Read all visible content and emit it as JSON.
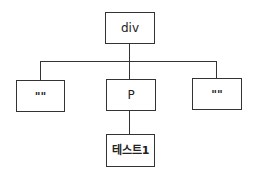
{
  "diagram": {
    "type": "tree",
    "root": {
      "label": "div"
    },
    "children": [
      {
        "label": "\"\""
      },
      {
        "label": "P",
        "children": [
          {
            "label": "테스트1"
          }
        ]
      },
      {
        "label": "\"\""
      }
    ],
    "colors": {
      "stroke": "#333333",
      "background": "#ffffff",
      "text": "#222222"
    }
  },
  "nodes": {
    "div": "div",
    "left_text": "\"\"",
    "p": "P",
    "right_text": "\"\"",
    "p_text": "테스트1"
  }
}
